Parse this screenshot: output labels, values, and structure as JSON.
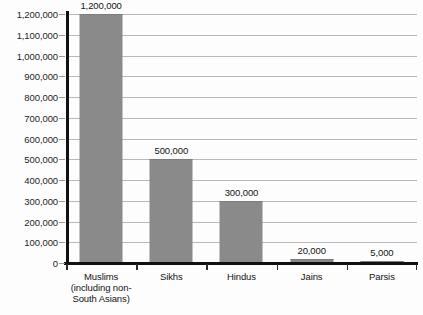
{
  "chart_data": {
    "type": "bar",
    "title": "",
    "subtitle": "",
    "xlabel": "",
    "ylabel": "",
    "categories": [
      "Muslims (including non-South Asians)",
      "Sikhs",
      "Hindus",
      "Jains",
      "Parsis"
    ],
    "category_lines": [
      [
        "Muslims",
        "(including non-",
        "South Asians)"
      ],
      [
        "Sikhs"
      ],
      [
        "Hindus"
      ],
      [
        "Jains"
      ],
      [
        "Parsis"
      ]
    ],
    "values": [
      1200000,
      500000,
      300000,
      20000,
      5000
    ],
    "value_labels": [
      "1,200,000",
      "500,000",
      "300,000",
      "20,000",
      "5,000"
    ],
    "ylim": [
      0,
      1200000
    ],
    "ytick_values": [
      0,
      100000,
      200000,
      300000,
      400000,
      500000,
      600000,
      700000,
      800000,
      900000,
      1000000,
      1100000,
      1200000
    ],
    "ytick_labels": [
      "0",
      "100,000",
      "200,000",
      "300,000",
      "400,000",
      "500,000",
      "600,000",
      "700,000",
      "800,000",
      "900,000",
      "1,000,000",
      "1,100,000",
      "1,200,000"
    ],
    "grid": true,
    "grid_axis": "y",
    "legend": false,
    "legend_position": "none",
    "bar_color": "#8a8a8a",
    "grid_color": "#b9b9b9",
    "axis_color": "#111111",
    "background_color": "#fdfdfd",
    "text_color": "#141414",
    "data_labels_shown": true
  }
}
